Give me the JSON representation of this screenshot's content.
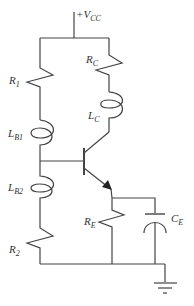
{
  "diagram": {
    "type": "circuit-schematic",
    "supply": {
      "label_main": "+V",
      "label_sub": "CC"
    },
    "components": {
      "R1": {
        "label_main": "R",
        "label_sub": "1"
      },
      "R2": {
        "label_main": "R",
        "label_sub": "2"
      },
      "RC": {
        "label_main": "R",
        "label_sub": "C"
      },
      "RE": {
        "label_main": "R",
        "label_sub": "E"
      },
      "LB1": {
        "label_main": "L",
        "label_sub": "B1"
      },
      "LB2": {
        "label_main": "L",
        "label_sub": "B2"
      },
      "LC": {
        "label_main": "L",
        "label_sub": "C"
      },
      "CE": {
        "label_main": "C",
        "label_sub": "E"
      },
      "Q": {
        "type": "NPN transistor"
      },
      "GND": {
        "type": "ground"
      }
    },
    "colors": {
      "wire": "#444444",
      "text": "#333333",
      "background": "#ffffff"
    }
  }
}
